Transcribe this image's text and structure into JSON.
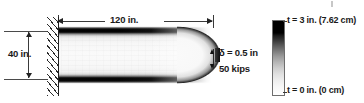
{
  "dimensions": {
    "length_label": "120 in.",
    "height_label": "40 in."
  },
  "tip_annotations": {
    "deflection_label": "δ = 0.5 in",
    "load_label": "50 kips"
  },
  "colorbar": {
    "max_label": "t = 3 in. (7.62 cm)",
    "min_label": "t = 0 in. (0 cm)",
    "max_value": 3,
    "min_value": 0,
    "units": "in.",
    "max_color": "#000000",
    "min_color": "#ffffff"
  },
  "icons": {
    "wall_support": "fixed-support-hatching",
    "dimension_arrow": "dimension-arrow"
  },
  "chart_data": {
    "type": "heatmap",
    "xlabel": "120 in.",
    "ylabel": "40 in.",
    "colorbar_label": "t",
    "colorbar_ticks": [
      "t = 0 in. (0 cm)",
      "t = 3 in. (7.62 cm)"
    ],
    "colorbar_range": [
      0,
      3
    ],
    "colormap": "gray-inverted",
    "annotations": [
      "120 in.",
      "40 in.",
      "δ = 0.5 in",
      "50 kips"
    ],
    "grid": false,
    "legend_position": "right"
  }
}
